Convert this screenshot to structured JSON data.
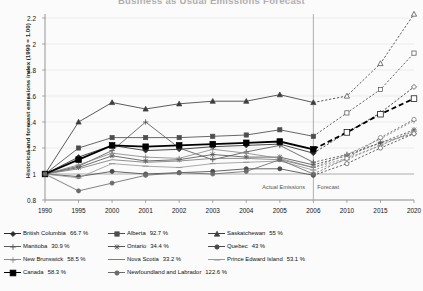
{
  "title": "Business as Usual Emissions Forecast",
  "axes": {
    "ylabel": "Historical and forecast emissions index (1990 = 1.00)",
    "yticks": [
      "0.8",
      "1",
      "1.2",
      "1.4",
      "1.6",
      "1.8",
      "2",
      "2.2"
    ],
    "xticks": [
      "1990",
      "1995",
      "2000",
      "2001",
      "2002",
      "2003",
      "2004",
      "2005",
      "2006",
      "2010",
      "2015",
      "2020"
    ],
    "actual_label": "Actual Emissions",
    "forecast_label": "Forecast"
  },
  "legend": [
    {
      "name": "British Columbia",
      "value": "66.7 %",
      "color": "#2b2b2b",
      "marker": "diamond"
    },
    {
      "name": "Alberta",
      "value": "92.7 %",
      "color": "#4d4d4d",
      "marker": "square"
    },
    {
      "name": "Saskatchewan",
      "value": "55 %",
      "color": "#3d3d3d",
      "marker": "triangle"
    },
    {
      "name": "Manitoba",
      "value": "30.9 %",
      "color": "#5a5a5a",
      "marker": "cross"
    },
    {
      "name": "Ontario",
      "value": "34.4 %",
      "color": "#565656",
      "marker": "star"
    },
    {
      "name": "Quebec",
      "value": "43 %",
      "color": "#4a4a4a",
      "marker": "circle"
    },
    {
      "name": "New Brunswick",
      "value": "58.5 %",
      "color": "#8a8a8a",
      "marker": "plus"
    },
    {
      "name": "Nova Scotia",
      "value": "33.2 %",
      "color": "#7d7d7d",
      "marker": "none"
    },
    {
      "name": "Prince Edward Island",
      "value": "53.1 %",
      "color": "#9a9a9a",
      "marker": "dash"
    },
    {
      "name": "Canada",
      "value": "58.3 %",
      "color": "#000000",
      "marker": "bigsquare"
    },
    {
      "name": "Newfoundland and Labrador",
      "value": "122.6 %",
      "color": "#6b6b6b",
      "marker": "circle"
    }
  ],
  "chart_data": {
    "type": "line",
    "title": "Business as Usual Emissions Forecast",
    "xlabel": "",
    "ylabel": "Historical and forecast emissions index (1990 = 1.00)",
    "x": [
      1990,
      1995,
      2000,
      2001,
      2002,
      2003,
      2004,
      2005,
      2006,
      2010,
      2015,
      2020
    ],
    "ylim": [
      0.8,
      2.2
    ],
    "xlim": [
      1990,
      2020
    ],
    "grid": true,
    "legend_position": "bottom",
    "forecast_start": 2006,
    "annotations": [
      "Actual Emissions",
      "Forecast"
    ],
    "series": [
      {
        "name": "British Columbia",
        "pct": 66.7,
        "color": "#2b2b2b",
        "marker": "diamond",
        "values": [
          1.0,
          1.13,
          1.22,
          1.18,
          1.19,
          1.21,
          1.22,
          1.23,
          1.16,
          1.32,
          1.47,
          1.67
        ]
      },
      {
        "name": "Alberta",
        "pct": 92.7,
        "color": "#4d4d4d",
        "marker": "square",
        "values": [
          1.0,
          1.2,
          1.28,
          1.28,
          1.28,
          1.29,
          1.3,
          1.34,
          1.29,
          1.47,
          1.65,
          1.93
        ]
      },
      {
        "name": "Saskatchewan",
        "pct": 55.0,
        "color": "#3d3d3d",
        "marker": "triangle",
        "values": [
          1.0,
          1.4,
          1.55,
          1.5,
          1.54,
          1.56,
          1.56,
          1.61,
          1.55,
          1.6,
          1.85,
          2.23
        ]
      },
      {
        "name": "Manitoba",
        "pct": 30.9,
        "color": "#5a5a5a",
        "marker": "cross",
        "values": [
          1.0,
          1.06,
          1.18,
          1.4,
          1.2,
          1.11,
          1.17,
          1.22,
          1.09,
          1.15,
          1.24,
          1.31
        ]
      },
      {
        "name": "Ontario",
        "pct": 34.4,
        "color": "#565656",
        "marker": "star",
        "values": [
          1.0,
          1.05,
          1.14,
          1.1,
          1.11,
          1.15,
          1.13,
          1.13,
          1.07,
          1.14,
          1.24,
          1.34
        ]
      },
      {
        "name": "Quebec",
        "pct": 43.0,
        "color": "#4a4a4a",
        "marker": "circle",
        "values": [
          1.0,
          0.98,
          1.02,
          1.0,
          1.01,
          1.02,
          1.04,
          1.04,
          0.99,
          1.08,
          1.2,
          1.31
        ]
      },
      {
        "name": "New Brunswick",
        "pct": 58.5,
        "color": "#8a8a8a",
        "marker": "plus",
        "values": [
          1.0,
          1.07,
          1.16,
          1.13,
          1.12,
          1.19,
          1.16,
          1.12,
          1.05,
          1.15,
          1.27,
          1.41
        ]
      },
      {
        "name": "Nova Scotia",
        "pct": 33.2,
        "color": "#7d7d7d",
        "marker": "none",
        "values": [
          1.0,
          1.04,
          1.11,
          1.09,
          1.1,
          1.12,
          1.12,
          1.11,
          1.05,
          1.12,
          1.22,
          1.33
        ]
      },
      {
        "name": "Prince Edward Island",
        "pct": 53.1,
        "color": "#9a9a9a",
        "marker": "dash",
        "values": [
          1.0,
          0.97,
          1.08,
          1.06,
          1.05,
          1.08,
          1.09,
          1.1,
          1.03,
          1.11,
          1.22,
          1.33
        ]
      },
      {
        "name": "Canada",
        "pct": 58.3,
        "color": "#000000",
        "marker": "bigsquare",
        "values": [
          1.0,
          1.11,
          1.22,
          1.21,
          1.22,
          1.23,
          1.24,
          1.25,
          1.19,
          1.32,
          1.46,
          1.58
        ]
      },
      {
        "name": "Newfoundland and Labrador",
        "pct": 122.6,
        "color": "#6b6b6b",
        "marker": "circle",
        "values": [
          1.0,
          0.87,
          0.93,
          0.99,
          1.01,
          1.0,
          1.02,
          1.11,
          1.0,
          1.12,
          1.28,
          1.42
        ]
      }
    ]
  }
}
